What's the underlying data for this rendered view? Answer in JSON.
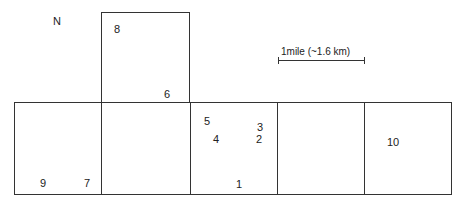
{
  "diagram": {
    "north_label": "N",
    "scale": {
      "label": "1mile (~1.6 km)"
    },
    "cells": [
      {
        "id": "top",
        "x": 101,
        "y": 12,
        "w": 89,
        "h": 91
      },
      {
        "id": "row-1",
        "x": 14,
        "y": 102,
        "w": 88,
        "h": 93
      },
      {
        "id": "row-2",
        "x": 101,
        "y": 102,
        "w": 90,
        "h": 93
      },
      {
        "id": "row-3",
        "x": 190,
        "y": 102,
        "w": 88,
        "h": 93
      },
      {
        "id": "row-4",
        "x": 277,
        "y": 102,
        "w": 88,
        "h": 93
      },
      {
        "id": "row-5",
        "x": 364,
        "y": 102,
        "w": 88,
        "h": 93
      }
    ],
    "sites": [
      {
        "label": "1",
        "x": 236,
        "y": 179
      },
      {
        "label": "2",
        "x": 256,
        "y": 134
      },
      {
        "label": "3",
        "x": 257,
        "y": 122
      },
      {
        "label": "4",
        "x": 213,
        "y": 134
      },
      {
        "label": "5",
        "x": 204,
        "y": 116
      },
      {
        "label": "6",
        "x": 164,
        "y": 89
      },
      {
        "label": "7",
        "x": 84,
        "y": 178
      },
      {
        "label": "8",
        "x": 114,
        "y": 24
      },
      {
        "label": "9",
        "x": 40,
        "y": 178
      },
      {
        "label": "10",
        "x": 387,
        "y": 137
      }
    ]
  }
}
